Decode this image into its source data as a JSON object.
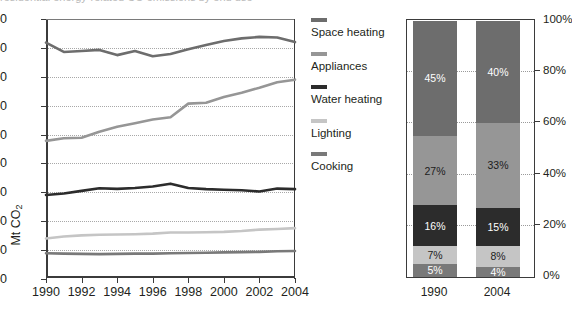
{
  "top_clipped_text": "residential energy-related CO emissions by end use",
  "line_chart": {
    "y_axis": {
      "label": "Mt CO",
      "label_sub": "2",
      "ticks": [
        "900",
        "800",
        "700",
        "600",
        "500",
        "400",
        "300",
        "200",
        "100",
        "0"
      ],
      "min": 0,
      "max": 900
    },
    "x_axis": {
      "ticks": [
        "1990",
        "1992",
        "1994",
        "1996",
        "1998",
        "2000",
        "2002",
        "2004"
      ],
      "min": 1990,
      "max": 2004
    }
  },
  "legend": {
    "items": [
      {
        "label": "Space heating",
        "color": "#6d6d6d"
      },
      {
        "label": "Appliances",
        "color": "#969696"
      },
      {
        "label": "Water heating",
        "color": "#2c2c2c"
      },
      {
        "label": "Lighting",
        "color": "#c5c5c5"
      },
      {
        "label": "Cooking",
        "color": "#797979"
      }
    ]
  },
  "bar_chart": {
    "y_axis": {
      "ticks": [
        "100%",
        "80%",
        "60%",
        "40%",
        "20%",
        "0%"
      ],
      "min": 0,
      "max": 100
    },
    "x_labels": [
      "1990",
      "2004"
    ]
  },
  "chart_data": [
    {
      "type": "line",
      "title": "",
      "xlabel": "",
      "ylabel": "Mt CO2",
      "ylim": [
        0,
        900
      ],
      "xlim": [
        1990,
        2004
      ],
      "grid": true,
      "legend_position": "right",
      "x": [
        1990,
        1991,
        1992,
        1993,
        1994,
        1995,
        1996,
        1997,
        1998,
        1999,
        2000,
        2001,
        2002,
        2003,
        2004
      ],
      "tick_labels": [
        "1990",
        "1992",
        "1994",
        "1996",
        "1998",
        "2000",
        "2002",
        "2004"
      ],
      "series": [
        {
          "name": "Space heating",
          "color": "#6d6d6d",
          "values": [
            818,
            786,
            789,
            793,
            775,
            789,
            771,
            779,
            795,
            810,
            824,
            833,
            838,
            836,
            820
          ]
        },
        {
          "name": "Appliances",
          "color": "#969696",
          "values": [
            478,
            487,
            489,
            510,
            527,
            539,
            552,
            560,
            607,
            610,
            630,
            645,
            662,
            681,
            690
          ]
        },
        {
          "name": "Water heating",
          "color": "#2c2c2c",
          "values": [
            291,
            296,
            305,
            314,
            312,
            315,
            320,
            330,
            315,
            311,
            309,
            307,
            303,
            313,
            311
          ]
        },
        {
          "name": "Lighting",
          "color": "#c5c5c5",
          "values": [
            140,
            147,
            151,
            153,
            154,
            155,
            157,
            161,
            161,
            162,
            163,
            166,
            171,
            173,
            176
          ]
        },
        {
          "name": "Cooking",
          "color": "#797979",
          "values": [
            89,
            88,
            87,
            86,
            87,
            88,
            88,
            89,
            90,
            91,
            92,
            93,
            94,
            96,
            97
          ]
        }
      ]
    },
    {
      "type": "bar",
      "stacked": true,
      "normalized": true,
      "title": "",
      "xlabel": "",
      "ylabel": "",
      "ylim": [
        0,
        100
      ],
      "grid": true,
      "categories": [
        "1990",
        "2004"
      ],
      "series": [
        {
          "name": "Space heating",
          "color": "#6d6d6d",
          "text_color": "#ffffff",
          "values": [
            45,
            40
          ],
          "labels": [
            "45%",
            "40%"
          ]
        },
        {
          "name": "Appliances",
          "color": "#969696",
          "text_color": "#1c1c1c",
          "values": [
            27,
            33
          ],
          "labels": [
            "27%",
            "33%"
          ]
        },
        {
          "name": "Water heating",
          "color": "#2c2c2c",
          "text_color": "#ffffff",
          "values": [
            16,
            15
          ],
          "labels": [
            "16%",
            "15%"
          ]
        },
        {
          "name": "Lighting",
          "color": "#c5c5c5",
          "text_color": "#1c1c1c",
          "values": [
            7,
            8
          ],
          "labels": [
            "7%",
            "8%"
          ]
        },
        {
          "name": "Cooking",
          "color": "#797979",
          "text_color": "#ffffff",
          "values": [
            5,
            4
          ],
          "labels": [
            "5%",
            "4%"
          ]
        }
      ]
    }
  ]
}
